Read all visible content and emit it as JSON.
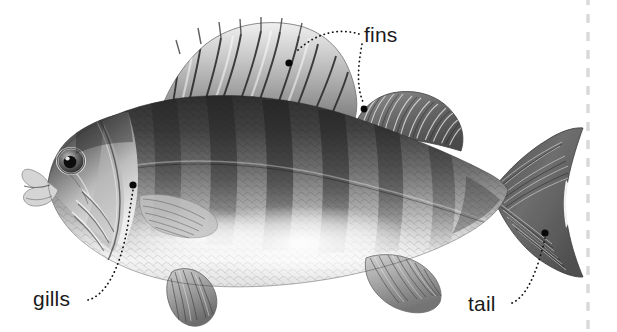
{
  "figure": {
    "background_color": "#ffffff",
    "width": 617,
    "height": 332,
    "style": "grayscale-pencil-illustration"
  },
  "callouts": [
    {
      "id": "fins",
      "label": "fins",
      "text_x": 364,
      "text_y": 42,
      "anchors": [
        {
          "name": "spiny-dorsal-fin",
          "x": 289,
          "y": 63
        },
        {
          "name": "soft-dorsal-fin",
          "x": 364,
          "y": 109
        }
      ]
    },
    {
      "id": "gills",
      "label": "gills",
      "text_x": 33,
      "text_y": 306,
      "anchors": [
        {
          "name": "gill-cover",
          "x": 133,
          "y": 185
        }
      ]
    },
    {
      "id": "tail",
      "label": "tail",
      "text_x": 468,
      "text_y": 311,
      "anchors": [
        {
          "name": "caudal-fin",
          "x": 545,
          "y": 233
        }
      ]
    }
  ],
  "crop_guide": {
    "name": "dashed-crop-line",
    "orientation": "vertical",
    "x": 588,
    "color": "#d9d9d9",
    "dash": "9 9"
  },
  "fish": {
    "name": "perch",
    "body_color_dark": "#3a3a3a",
    "body_color_mid": "#8a8a8a",
    "body_color_light": "#e8e8e8",
    "belly_color": "#fbfbfb",
    "stripe_color": "#2e2e2e",
    "parts": [
      "head",
      "eye",
      "mouth",
      "gill-cover",
      "spiny-dorsal-fin",
      "soft-dorsal-fin",
      "pectoral-fin",
      "pelvic-fin",
      "anal-fin",
      "caudal-fin",
      "body-stripes",
      "scales"
    ]
  }
}
